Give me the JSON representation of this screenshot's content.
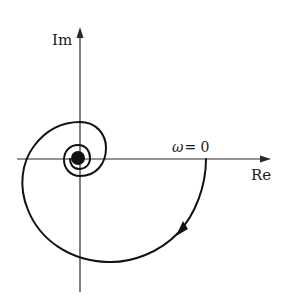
{
  "diagram": {
    "type": "nyquist-plot",
    "axes": {
      "imag_label": "Im",
      "real_label": "Re"
    },
    "annotations": {
      "start_point_label": "ω = 0",
      "omega_symbol": "ω",
      "omega_value": "= 0"
    },
    "curve": {
      "description": "Spiral beginning at ω=0 on positive real axis, circling clockwise and converging to origin",
      "direction": "clockwise",
      "arrow_position": "lower-right quadrant"
    },
    "colors": {
      "line": "#111111",
      "axis": "#2a2a2a",
      "background": "#ffffff"
    }
  }
}
